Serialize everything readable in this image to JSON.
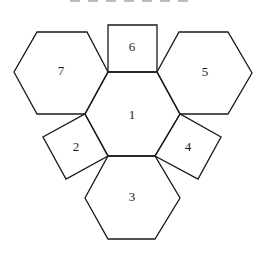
{
  "diagram": {
    "type": "polyhedron-net",
    "faces": [
      {
        "id": "1",
        "label": "1",
        "shape": "hexagon",
        "points": "108,72 157,72 180,114 155,156 108,156 85,114",
        "lx": 132,
        "ly": 116
      },
      {
        "id": "2",
        "label": "2",
        "shape": "square",
        "points": "85,114 108,156 66,179 43,137",
        "lx": 76,
        "ly": 148
      },
      {
        "id": "3",
        "label": "3",
        "shape": "hexagon",
        "points": "108,156 155,156 180,198 155,239 108,239 85,198",
        "lx": 132,
        "ly": 198
      },
      {
        "id": "4",
        "label": "4",
        "shape": "square",
        "points": "180,114 155,156 198,179 221,137",
        "lx": 188,
        "ly": 148
      },
      {
        "id": "5",
        "label": "5",
        "shape": "hexagon",
        "points": "179,32 228,32 252,73 228,114 180,114 157,72",
        "lx": 205,
        "ly": 73
      },
      {
        "id": "6",
        "label": "6",
        "shape": "square",
        "points": "108,25 157,25 157,72 108,72",
        "lx": 132,
        "ly": 48
      },
      {
        "id": "7",
        "label": "7",
        "shape": "hexagon",
        "points": "37,32 87,32 108,72 85,114 37,114 14,72",
        "lx": 61,
        "ly": 72
      }
    ]
  }
}
